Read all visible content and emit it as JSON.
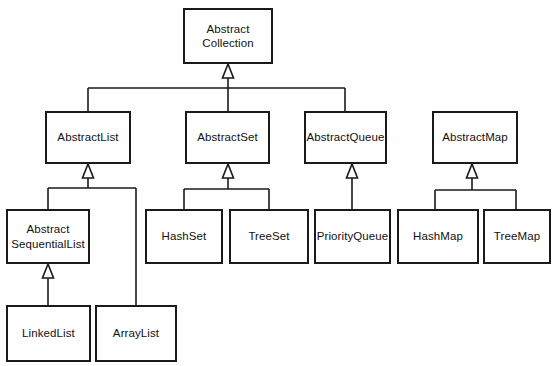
{
  "diagram": {
    "kind": "uml-class-hierarchy",
    "canvas": {
      "width": 554,
      "height": 366,
      "background": "#fefefe"
    },
    "style": {
      "box_fill": "#ffffff",
      "box_stroke": "#1a1a1a",
      "edge_stroke": "#1a1a1a",
      "text_color": "#111111",
      "arrowhead": "hollow-triangle-generalization"
    },
    "nodes": [
      {
        "id": "abstract-collection",
        "label": "Abstract\nCollection",
        "lines": [
          "Abstract",
          "Collection"
        ],
        "x": 183,
        "y": 8,
        "width": 90,
        "height": 56
      },
      {
        "id": "abstract-list",
        "label": "AbstractList",
        "lines": [
          "AbstractList"
        ],
        "x": 45,
        "y": 111,
        "width": 86,
        "height": 53
      },
      {
        "id": "abstract-set",
        "label": "AbstractSet",
        "lines": [
          "AbstractSet"
        ],
        "x": 185,
        "y": 111,
        "width": 85,
        "height": 53
      },
      {
        "id": "abstract-queue",
        "label": "AbstractQueue",
        "lines": [
          "AbstractQueue"
        ],
        "x": 304,
        "y": 111,
        "width": 83,
        "height": 53
      },
      {
        "id": "abstract-map",
        "label": "AbstractMap",
        "lines": [
          "AbstractMap"
        ],
        "x": 432,
        "y": 111,
        "width": 86,
        "height": 53
      },
      {
        "id": "abstract-sequential-list",
        "label": "Abstract\nSequentialList",
        "lines": [
          "Abstract",
          "SequentialList"
        ],
        "x": 6,
        "y": 209,
        "width": 84,
        "height": 55
      },
      {
        "id": "hash-set",
        "label": "HashSet",
        "lines": [
          "HashSet"
        ],
        "x": 145,
        "y": 209,
        "width": 78,
        "height": 55
      },
      {
        "id": "tree-set",
        "label": "TreeSet",
        "lines": [
          "TreeSet"
        ],
        "x": 229,
        "y": 209,
        "width": 80,
        "height": 55
      },
      {
        "id": "priority-queue",
        "label": "PriorityQueue",
        "lines": [
          "PriorityQueue"
        ],
        "x": 314,
        "y": 209,
        "width": 77,
        "height": 55
      },
      {
        "id": "hash-map",
        "label": "HashMap",
        "lines": [
          "HashMap"
        ],
        "x": 397,
        "y": 209,
        "width": 82,
        "height": 55
      },
      {
        "id": "tree-map",
        "label": "TreeMap",
        "lines": [
          "TreeMap"
        ],
        "x": 483,
        "y": 209,
        "width": 68,
        "height": 55
      },
      {
        "id": "linked-list",
        "label": "LinkedList",
        "lines": [
          "LinkedList"
        ],
        "x": 6,
        "y": 305,
        "width": 85,
        "height": 57
      },
      {
        "id": "array-list",
        "label": "ArrayList",
        "lines": [
          "ArrayList"
        ],
        "x": 95,
        "y": 305,
        "width": 82,
        "height": 57
      }
    ],
    "edges": [
      {
        "id": "edge-abstractlist-to-abstractcollection",
        "child": "abstract-list",
        "parent": "abstract-collection",
        "relation": "generalization"
      },
      {
        "id": "edge-abstractset-to-abstractcollection",
        "child": "abstract-set",
        "parent": "abstract-collection",
        "relation": "generalization"
      },
      {
        "id": "edge-abstractqueue-to-abstractcollection",
        "child": "abstract-queue",
        "parent": "abstract-collection",
        "relation": "generalization"
      },
      {
        "id": "edge-abstractsequentiallist-to-abstractlist",
        "child": "abstract-sequential-list",
        "parent": "abstract-list",
        "relation": "generalization"
      },
      {
        "id": "edge-arraylist-to-abstractlist",
        "child": "array-list",
        "parent": "abstract-list",
        "relation": "generalization"
      },
      {
        "id": "edge-linkedlist-to-abstractsequentiallist",
        "child": "linked-list",
        "parent": "abstract-sequential-list",
        "relation": "generalization"
      },
      {
        "id": "edge-hashset-to-abstractset",
        "child": "hash-set",
        "parent": "abstract-set",
        "relation": "generalization"
      },
      {
        "id": "edge-treeset-to-abstractset",
        "child": "tree-set",
        "parent": "abstract-set",
        "relation": "generalization"
      },
      {
        "id": "edge-priorityqueue-to-abstractqueue",
        "child": "priority-queue",
        "parent": "abstract-queue",
        "relation": "generalization"
      },
      {
        "id": "edge-hashmap-to-abstractmap",
        "child": "hash-map",
        "parent": "abstract-map",
        "relation": "generalization"
      },
      {
        "id": "edge-treemap-to-abstractmap",
        "child": "tree-map",
        "parent": "abstract-map",
        "relation": "generalization"
      }
    ]
  }
}
